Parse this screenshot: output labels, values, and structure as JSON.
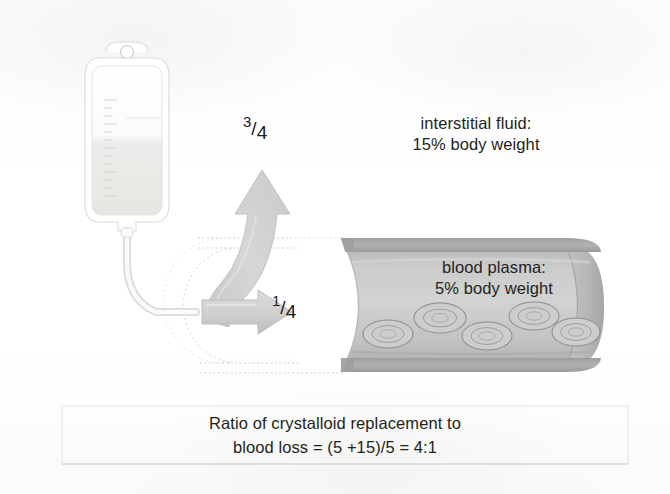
{
  "figure": {
    "title_present": false,
    "background_color": "#fdfdfc"
  },
  "labels": {
    "interstitial": "interstitial fluid:\n15% body weight",
    "plasma": "blood plasma:\n5% body weight",
    "caption": "Ratio of crystalloid replacement to\nblood loss  = (5 +15)/5 = 4:1"
  },
  "fractions": {
    "up_arrow": {
      "numerator": "3",
      "slash": "/",
      "denominator": "4"
    },
    "right_arrow": {
      "numerator": "1",
      "slash": "/",
      "denominator": "4"
    }
  },
  "elements": {
    "iv_bag_name": "iv-fluid-bag",
    "iv_tube_name": "iv-tubing",
    "curved_arrow_name": "curved-arrow-to-interstitial",
    "straight_arrow_name": "straight-arrow-to-plasma",
    "vessel_name": "blood-vessel",
    "rbc_name": "red-blood-cell",
    "caption_box_name": "caption-box"
  },
  "colors": {
    "arrow_fill": "#d4d4d4",
    "arrow_stroke": "#bdbdbd",
    "vessel_wall": "#a8a8a8",
    "vessel_lumen": "#c9c9c9",
    "vessel_cap": "#b4b4b4",
    "rbc_stroke": "#8e8e8e",
    "text": "#231f20",
    "bag_outline": "#d8d8d8",
    "bag_fluid": "#e9e9e7",
    "caption_border": "#e2e2e0",
    "dotted_guide": "#cfcfcf"
  },
  "rbc_positions": [
    {
      "cx": 388,
      "cy": 334,
      "rx": 25,
      "ry": 14
    },
    {
      "cx": 440,
      "cy": 318,
      "rx": 26,
      "ry": 15
    },
    {
      "cx": 487,
      "cy": 336,
      "rx": 25,
      "ry": 14
    },
    {
      "cx": 534,
      "cy": 316,
      "rx": 25,
      "ry": 14
    },
    {
      "cx": 576,
      "cy": 332,
      "rx": 24,
      "ry": 14
    }
  ]
}
